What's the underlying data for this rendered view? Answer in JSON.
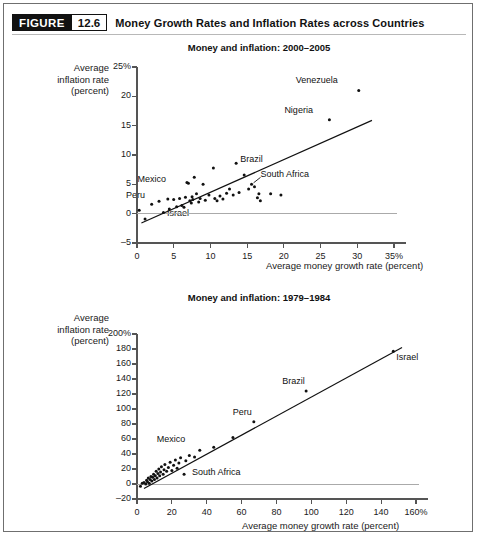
{
  "header": {
    "badge_label": "FIGURE",
    "badge_number": "12.6",
    "title": "Money Growth Rates and Inflation Rates across Countries"
  },
  "chart_data": [
    {
      "type": "scatter",
      "id": "top",
      "title": "Money and inflation: 2000–2005",
      "xlabel": "Average money growth rate (percent)",
      "ylabel": "Average inflation rate (percent)",
      "ylabel_lines": [
        "Average",
        "inflation rate",
        "(percent)"
      ],
      "xlim": [
        0,
        35
      ],
      "ylim": [
        -5,
        25
      ],
      "xticks": [
        0,
        5,
        10,
        15,
        20,
        25,
        30,
        35
      ],
      "xtick_labels": [
        "0",
        "5",
        "10",
        "15",
        "20",
        "25",
        "30",
        "35%"
      ],
      "yticks": [
        -5,
        0,
        5,
        10,
        15,
        20,
        25
      ],
      "ytick_labels": [
        "–5",
        "0",
        "5",
        "10",
        "15",
        "20",
        "25%"
      ],
      "grid": false,
      "zero_line": true,
      "trend_line": {
        "x1": 0.6,
        "y1": -1.6,
        "x2": 32.0,
        "y2": 15.9
      },
      "labeled_points": [
        {
          "name": "Venezuela",
          "x": 30.2,
          "y": 21.0,
          "label_dx": -31,
          "label_dy": -9
        },
        {
          "name": "Nigeria",
          "x": 26.2,
          "y": 16.0,
          "label_dx": -26,
          "label_dy": -9
        },
        {
          "name": "Brazil",
          "x": 13.5,
          "y": 8.6,
          "label_dx": 4,
          "label_dy": -3
        },
        {
          "name": "South Africa",
          "x": 15.6,
          "y": 5.0,
          "label_dx": 9,
          "label_dy": -9,
          "leader": true
        },
        {
          "name": "Mexico",
          "x": 7.0,
          "y": 5.2,
          "label_dx": -32,
          "label_dy": -3
        },
        {
          "name": "Peru",
          "x": 3.0,
          "y": 2.1,
          "label_dx": -24,
          "label_dy": -5
        },
        {
          "name": "Israel",
          "x": 6.4,
          "y": 1.1,
          "label_dx": -5,
          "label_dy": 7
        }
      ],
      "points": [
        {
          "x": 0.3,
          "y": 0.6
        },
        {
          "x": 1.1,
          "y": -0.9
        },
        {
          "x": 2.0,
          "y": 1.6
        },
        {
          "x": 3.0,
          "y": 2.1
        },
        {
          "x": 3.6,
          "y": 0.2
        },
        {
          "x": 4.2,
          "y": 2.5
        },
        {
          "x": 4.4,
          "y": 0.8
        },
        {
          "x": 5.0,
          "y": 2.4
        },
        {
          "x": 5.4,
          "y": 1.2
        },
        {
          "x": 5.8,
          "y": 2.6
        },
        {
          "x": 6.1,
          "y": 1.4
        },
        {
          "x": 6.4,
          "y": 1.1
        },
        {
          "x": 6.6,
          "y": 2.8
        },
        {
          "x": 6.8,
          "y": 5.3
        },
        {
          "x": 7.0,
          "y": 5.2
        },
        {
          "x": 7.2,
          "y": 2.2
        },
        {
          "x": 7.4,
          "y": 1.8
        },
        {
          "x": 7.5,
          "y": 2.9
        },
        {
          "x": 7.6,
          "y": 2.4
        },
        {
          "x": 7.8,
          "y": 6.2
        },
        {
          "x": 8.1,
          "y": 3.4
        },
        {
          "x": 8.4,
          "y": 2.0
        },
        {
          "x": 8.6,
          "y": 2.6
        },
        {
          "x": 9.0,
          "y": 5.0
        },
        {
          "x": 9.3,
          "y": 2.3
        },
        {
          "x": 9.8,
          "y": 3.2
        },
        {
          "x": 10.4,
          "y": 7.8
        },
        {
          "x": 10.6,
          "y": 2.6
        },
        {
          "x": 10.9,
          "y": 2.2
        },
        {
          "x": 11.3,
          "y": 3.0
        },
        {
          "x": 11.7,
          "y": 2.5
        },
        {
          "x": 12.2,
          "y": 3.5
        },
        {
          "x": 12.6,
          "y": 4.2
        },
        {
          "x": 13.1,
          "y": 3.2
        },
        {
          "x": 13.5,
          "y": 8.6
        },
        {
          "x": 13.9,
          "y": 3.6
        },
        {
          "x": 14.6,
          "y": 6.6
        },
        {
          "x": 15.2,
          "y": 4.2
        },
        {
          "x": 15.6,
          "y": 5.0
        },
        {
          "x": 16.0,
          "y": 4.6
        },
        {
          "x": 16.4,
          "y": 2.7
        },
        {
          "x": 16.6,
          "y": 3.4
        },
        {
          "x": 16.8,
          "y": 2.2
        },
        {
          "x": 18.2,
          "y": 3.4
        },
        {
          "x": 19.6,
          "y": 3.2
        },
        {
          "x": 26.2,
          "y": 16.0
        },
        {
          "x": 30.2,
          "y": 21.0
        }
      ]
    },
    {
      "type": "scatter",
      "id": "bottom",
      "title": "Money and inflation: 1979–1984",
      "xlabel": "Average money growth rate (percent)",
      "ylabel": "Average inflation rate (percent)",
      "ylabel_lines": [
        "Average",
        "inflation rate",
        "(percent)"
      ],
      "xlim": [
        0,
        160
      ],
      "ylim": [
        -20,
        200
      ],
      "xticks": [
        0,
        20,
        40,
        60,
        80,
        100,
        120,
        140,
        160
      ],
      "xtick_labels": [
        "0",
        "20",
        "40",
        "60",
        "80",
        "100",
        "120",
        "140",
        "160%"
      ],
      "yticks": [
        -20,
        0,
        20,
        40,
        60,
        80,
        100,
        120,
        140,
        160,
        180,
        200
      ],
      "ytick_labels": [
        "–20",
        "0",
        "20",
        "40",
        "60",
        "80",
        "100",
        "120",
        "140",
        "160",
        "180",
        "200%"
      ],
      "grid": false,
      "zero_line": true,
      "trend_line": {
        "x1": 4.0,
        "y1": -6.0,
        "x2": 152.0,
        "y2": 182.0
      },
      "labeled_points": [
        {
          "name": "Israel",
          "x": 147.0,
          "y": 177.0,
          "label_dx": 3,
          "label_dy": 7
        },
        {
          "name": "Brazil",
          "x": 97.0,
          "y": 124.0,
          "label_dx": -11,
          "label_dy": -9
        },
        {
          "name": "Peru",
          "x": 67.0,
          "y": 83.0,
          "label_dx": -12,
          "label_dy": -9
        },
        {
          "name": "Mexico",
          "x": 44.0,
          "y": 49.0,
          "label_dx": -38,
          "label_dy": -7
        },
        {
          "name": "South Africa",
          "x": 27.0,
          "y": 13.0,
          "label_dx": 8,
          "label_dy": -1
        }
      ],
      "points": [
        {
          "x": 2.0,
          "y": -3.0
        },
        {
          "x": 3.0,
          "y": 1.0
        },
        {
          "x": 4.0,
          "y": 2.0
        },
        {
          "x": 5.0,
          "y": 0.0
        },
        {
          "x": 5.5,
          "y": 5.0
        },
        {
          "x": 6.0,
          "y": 3.0
        },
        {
          "x": 6.5,
          "y": 8.0
        },
        {
          "x": 7.0,
          "y": 1.0
        },
        {
          "x": 7.5,
          "y": 6.0
        },
        {
          "x": 8.0,
          "y": 10.0
        },
        {
          "x": 8.5,
          "y": 4.0
        },
        {
          "x": 9.0,
          "y": 9.0
        },
        {
          "x": 9.5,
          "y": 13.0
        },
        {
          "x": 10.0,
          "y": 6.0
        },
        {
          "x": 10.5,
          "y": 11.0
        },
        {
          "x": 11.0,
          "y": 17.0
        },
        {
          "x": 11.5,
          "y": 8.0
        },
        {
          "x": 12.0,
          "y": 14.0
        },
        {
          "x": 12.5,
          "y": 20.0
        },
        {
          "x": 13.0,
          "y": 11.0
        },
        {
          "x": 13.5,
          "y": 16.0
        },
        {
          "x": 14.0,
          "y": 23.0
        },
        {
          "x": 15.0,
          "y": 13.0
        },
        {
          "x": 15.5,
          "y": 19.0
        },
        {
          "x": 16.0,
          "y": 26.0
        },
        {
          "x": 17.0,
          "y": 17.0
        },
        {
          "x": 18.0,
          "y": 22.0
        },
        {
          "x": 19.0,
          "y": 29.0
        },
        {
          "x": 20.0,
          "y": 18.0
        },
        {
          "x": 21.0,
          "y": 25.0
        },
        {
          "x": 22.0,
          "y": 32.0
        },
        {
          "x": 23.0,
          "y": 21.0
        },
        {
          "x": 24.0,
          "y": 28.0
        },
        {
          "x": 25.0,
          "y": 35.0
        },
        {
          "x": 27.0,
          "y": 13.0
        },
        {
          "x": 28.0,
          "y": 31.0
        },
        {
          "x": 30.0,
          "y": 38.0
        },
        {
          "x": 33.0,
          "y": 36.0
        },
        {
          "x": 36.0,
          "y": 45.0
        },
        {
          "x": 44.0,
          "y": 49.0
        },
        {
          "x": 55.0,
          "y": 62.0
        },
        {
          "x": 67.0,
          "y": 83.0
        },
        {
          "x": 97.0,
          "y": 124.0
        },
        {
          "x": 147.0,
          "y": 177.0
        }
      ]
    }
  ]
}
